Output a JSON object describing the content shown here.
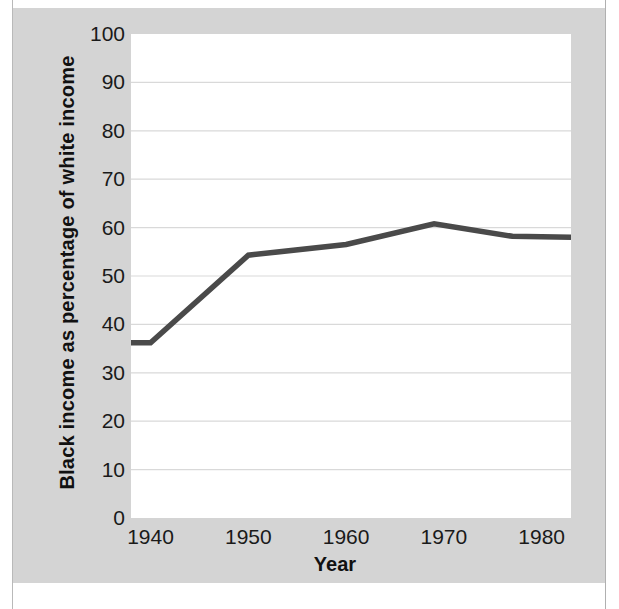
{
  "figure": {
    "background_color": "#ffffff",
    "plate_color": "#d4d4d4",
    "plot_background": "#ffffff",
    "line_color": "#4a4a4a",
    "gridline_color": "#d9d9d9",
    "axis_text_color": "#1a1a1a"
  },
  "chart_data": {
    "type": "line",
    "title": "",
    "xlabel": "Year",
    "ylabel": "Black income as  percentage of white income",
    "xlim": [
      1938,
      1983
    ],
    "ylim": [
      0,
      100
    ],
    "grid": true,
    "legend": "none",
    "xticks": [
      1940,
      1950,
      1960,
      1970,
      1980
    ],
    "xtick_labels": [
      "1940",
      "1950",
      "1960",
      "1970",
      "1980"
    ],
    "yticks": [
      0,
      10,
      20,
      30,
      40,
      50,
      60,
      70,
      80,
      90,
      100
    ],
    "ytick_labels": [
      "0",
      "10",
      "20",
      "30",
      "40",
      "50",
      "60",
      "70",
      "80",
      "90",
      "100"
    ],
    "series": [
      {
        "name": "Black income as percentage of white income",
        "x": [
          1938,
          1940,
          1950,
          1960,
          1969,
          1977,
          1983
        ],
        "values": [
          36.2,
          36.2,
          54.3,
          56.5,
          60.8,
          58.2,
          58.0
        ]
      }
    ]
  }
}
